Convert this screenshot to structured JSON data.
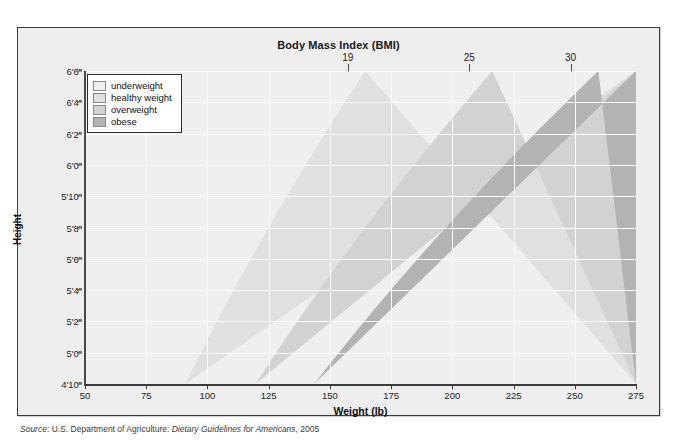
{
  "chart_data": {
    "type": "area",
    "title": "Body Mass Index (BMI)",
    "xlabel": "Weight (lb)",
    "ylabel": "Height",
    "xlim": [
      50,
      275
    ],
    "ylim_inches": [
      58,
      78
    ],
    "xticks": [
      50,
      75,
      100,
      125,
      150,
      175,
      200,
      225,
      250,
      275
    ],
    "xtick_labels": [
      "50",
      "75",
      "100",
      "125",
      "150",
      "175",
      "200",
      "225",
      "250",
      "275"
    ],
    "yticks_inches": [
      58,
      60,
      62,
      64,
      66,
      68,
      70,
      72,
      74,
      76,
      78
    ],
    "ytick_labels": [
      "4'10”",
      "5'0”",
      "5'2”",
      "5'4”",
      "5'6”",
      "5'8”",
      "5'10”",
      "6'0”",
      "6'2”",
      "6'4”",
      "6'6”"
    ],
    "top_axis_label": "Body Mass Index (BMI)",
    "bmi_boundaries": [
      19,
      25,
      30
    ],
    "bmi_boundary_labels": [
      "19",
      "25",
      "30"
    ],
    "bmi_label_weights_at_top": [
      157.3,
      206.9,
      248.3
    ],
    "grid": true,
    "legend_position": "top-left",
    "bands": [
      {
        "name": "underweight",
        "bmi_range": [
          0,
          19
        ],
        "color": "#efefef"
      },
      {
        "name": "healthy weight",
        "bmi_range": [
          19,
          25
        ],
        "color": "#e0e0e0"
      },
      {
        "name": "overweight",
        "bmi_range": [
          25,
          30
        ],
        "color": "#d2d2d2"
      },
      {
        "name": "obese",
        "bmi_range": [
          30,
          99
        ],
        "color": "#b3b3b3"
      }
    ]
  },
  "title": "Body Mass Index (BMI)",
  "axes": {
    "x_title": "Weight (lb)",
    "y_title": "Height",
    "x_ticks": [
      "50",
      "75",
      "100",
      "125",
      "150",
      "175",
      "200",
      "225",
      "250",
      "275"
    ],
    "y_ticks": [
      "6'6”",
      "6'4”",
      "6'2”",
      "6'0”",
      "5'10”",
      "5'8”",
      "5'6”",
      "5'4”",
      "5'2”",
      "5'0”",
      "4'10”"
    ],
    "bmi_ticks": [
      "19",
      "25",
      "30"
    ]
  },
  "legend": {
    "items": [
      {
        "label": "underweight",
        "color": "#efefef"
      },
      {
        "label": "healthy weight",
        "color": "#e0e0e0"
      },
      {
        "label": "overweight",
        "color": "#d2d2d2"
      },
      {
        "label": "obese",
        "color": "#b3b3b3"
      }
    ]
  },
  "source": {
    "prefix": "Source",
    "separator": ": ",
    "agency": "U.S. Department of Agriculture: ",
    "document": "Dietary Guidelines for Americans",
    "year": ", 2005"
  },
  "colors": {
    "frame_border": "#3a3a3a",
    "figure_background": "#eeeeee",
    "plot_background": "#ededed",
    "gridline": "#fbfbfb",
    "axis": "#3c3c3c",
    "text": "#1a1a1a"
  }
}
